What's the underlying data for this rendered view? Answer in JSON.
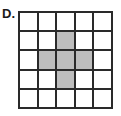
{
  "label": "D.",
  "grid": {
    "rows": 5,
    "cols": 5,
    "shade_color": "#bdbdbd",
    "shaded": [
      [
        1,
        2
      ],
      [
        2,
        1
      ],
      [
        2,
        2
      ],
      [
        2,
        3
      ],
      [
        3,
        2
      ]
    ]
  }
}
